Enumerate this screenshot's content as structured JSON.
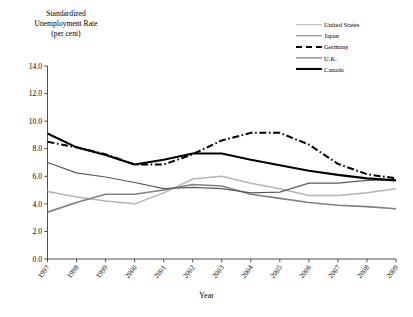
{
  "chart_data": {
    "type": "line",
    "title": "",
    "ylabel": "Standardized\nUnemployment Rate\n(per cent)",
    "xlabel": "Year",
    "x": [
      1997,
      1998,
      1999,
      2000,
      2001,
      2002,
      2003,
      2004,
      2005,
      2006,
      2007,
      2008,
      2009
    ],
    "xtick_labels": [
      "1997",
      "1998",
      "1999",
      "2000",
      "2001",
      "2002",
      "2003",
      "2004",
      "2005",
      "2006",
      "2007",
      "2008",
      "2009"
    ],
    "ytick_labels": [
      "0.0",
      "2.0",
      "4.0",
      "6.0",
      "8.0",
      "10.0",
      "12.0",
      "14.0"
    ],
    "ytick_values": [
      0.0,
      2.0,
      4.0,
      6.0,
      8.0,
      10.0,
      12.0,
      14.0
    ],
    "ylim": [
      0.0,
      14.0
    ],
    "xlim": [
      1997,
      2009
    ],
    "grid": false,
    "legend_position": "top-right",
    "series": [
      {
        "name": "United States",
        "color": "#b4b4b4",
        "style": "solid",
        "width": 1.5,
        "values": [
          4.9,
          4.5,
          4.2,
          4.0,
          4.8,
          5.8,
          6.0,
          5.5,
          5.1,
          4.6,
          4.6,
          4.8,
          5.1
        ]
      },
      {
        "name": "Japan",
        "color": "#808080",
        "style": "solid",
        "width": 1.6,
        "values": [
          3.4,
          4.1,
          4.7,
          4.7,
          5.0,
          5.4,
          5.3,
          4.7,
          4.4,
          4.1,
          3.9,
          3.8,
          3.65
        ]
      },
      {
        "name": "Germany",
        "color": "#000000",
        "style": "dashed",
        "width": 2.0,
        "values": [
          8.5,
          8.1,
          7.6,
          6.85,
          6.85,
          7.6,
          8.6,
          9.15,
          9.15,
          8.3,
          6.9,
          6.15,
          5.85
        ]
      },
      {
        "name": "U.K.",
        "color": "#5a5a5a",
        "style": "solid",
        "width": 1.2,
        "values": [
          7.0,
          6.25,
          5.95,
          5.55,
          5.1,
          5.2,
          5.1,
          4.8,
          4.85,
          5.5,
          5.5,
          5.7,
          5.75
        ]
      },
      {
        "name": "Canada",
        "color": "#000000",
        "style": "solid",
        "width": 2.1,
        "values": [
          9.1,
          8.1,
          7.55,
          6.85,
          7.2,
          7.65,
          7.65,
          7.2,
          6.8,
          6.4,
          6.1,
          5.85,
          5.7
        ]
      }
    ]
  },
  "axis": {
    "y_title_line1": "Standardized",
    "y_title_line2": "Unemployment Rate",
    "y_title_line3": "(per cent)",
    "x_title": "Year"
  },
  "legend": {
    "items": [
      {
        "label": "United States",
        "color": "#b4b4b4",
        "style": "solid"
      },
      {
        "label": "Japan",
        "color": "#808080",
        "style": "solid"
      },
      {
        "label": "Germany",
        "color": "#000000",
        "style": "dashed"
      },
      {
        "label": "U.K.",
        "color": "#5a5a5a",
        "style": "solid"
      },
      {
        "label": "Canada",
        "color": "#000000",
        "style": "solid"
      }
    ]
  }
}
